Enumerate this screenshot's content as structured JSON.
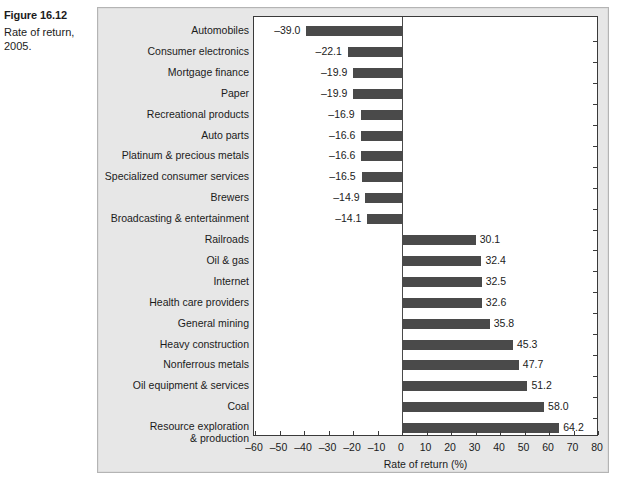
{
  "caption": {
    "figure_number": "Figure 16.12",
    "figure_title": "Rate of return, 2005."
  },
  "chart_data": {
    "type": "bar",
    "orientation": "horizontal",
    "title": "Rate of return, 2005.",
    "xlabel": "Rate of return (%)",
    "ylabel": "",
    "xlim": [
      -60,
      80
    ],
    "xticks": [
      "–60",
      "–50",
      "–40",
      "–30",
      "–20",
      "–10",
      "0",
      "10",
      "20",
      "30",
      "40",
      "50",
      "60",
      "70",
      "80"
    ],
    "xtick_values": [
      -60,
      -50,
      -40,
      -30,
      -20,
      -10,
      0,
      10,
      20,
      30,
      40,
      50,
      60,
      70,
      80
    ],
    "grid": false,
    "legend": null,
    "bar_color": "#4a4a4a",
    "plot_background": "#ffffff",
    "panel_background": "#e7e7e7",
    "categories": [
      "Automobiles",
      "Consumer electronics",
      "Mortgage finance",
      "Paper",
      "Recreational products",
      "Auto parts",
      "Platinum & precious metals",
      "Specialized consumer services",
      "Brewers",
      "Broadcasting & entertainment",
      "Railroads",
      "Oil & gas",
      "Internet",
      "Health care providers",
      "General mining",
      "Heavy construction",
      "Nonferrous metals",
      "Oil equipment & services",
      "Coal",
      "Resource exploration & production"
    ],
    "values": [
      -39.0,
      -22.1,
      -19.9,
      -19.9,
      -16.9,
      -16.6,
      -16.6,
      -16.5,
      -14.9,
      -14.1,
      30.1,
      32.4,
      32.5,
      32.6,
      35.8,
      45.3,
      47.7,
      51.2,
      58.0,
      64.2
    ],
    "data_labels": [
      "–39.0",
      "–22.1",
      "–19.9",
      "–19.9",
      "–16.9",
      "–16.6",
      "–16.6",
      "–16.5",
      "–14.9",
      "–14.1",
      "30.1",
      "32.4",
      "32.5",
      "32.6",
      "35.8",
      "45.3",
      "47.7",
      "51.2",
      "58.0",
      "64.2"
    ]
  }
}
